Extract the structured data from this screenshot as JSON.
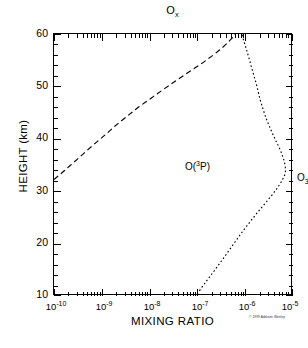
{
  "chart_data": {
    "type": "line",
    "title": "Ox",
    "title_base": "O",
    "title_sub": "x",
    "xlabel": "MIXING RATIO",
    "ylabel": "HEIGHT (km)",
    "xscale": "log",
    "yscale": "linear",
    "xlim": [
      1e-10,
      1e-05
    ],
    "ylim": [
      10,
      60
    ],
    "grid": false,
    "legend": "inline annotations",
    "x_tick_labels": [
      {
        "base": "10",
        "exp": "-10",
        "value": 1e-10
      },
      {
        "base": "10",
        "exp": "-9",
        "value": 1e-09
      },
      {
        "base": "10",
        "exp": "-8",
        "value": 1e-08
      },
      {
        "base": "10",
        "exp": "-7",
        "value": 1e-07
      },
      {
        "base": "10",
        "exp": "-6",
        "value": 1e-06
      },
      {
        "base": "10",
        "exp": "-5",
        "value": 1e-05
      }
    ],
    "y_tick_labels": [
      {
        "label": "10",
        "value": 10
      },
      {
        "label": "20",
        "value": 20
      },
      {
        "label": "30",
        "value": 30
      },
      {
        "label": "40",
        "value": 40
      },
      {
        "label": "50",
        "value": 50
      },
      {
        "label": "60",
        "value": 60
      }
    ],
    "y_minor_step": 2,
    "series": [
      {
        "name": "O(3P)",
        "label_base": "O(",
        "label_sup": "3",
        "label_tail": "P)",
        "linestyle": "dashed",
        "color": "#000000",
        "points": [
          {
            "x": 1e-10,
            "y": 32.0
          },
          {
            "x": 1.6e-10,
            "y": 33.6
          },
          {
            "x": 2.6e-10,
            "y": 35.3
          },
          {
            "x": 4.2e-10,
            "y": 37.0
          },
          {
            "x": 7e-10,
            "y": 38.8
          },
          {
            "x": 1.2e-09,
            "y": 40.6
          },
          {
            "x": 2e-09,
            "y": 42.4
          },
          {
            "x": 3.4e-09,
            "y": 44.1
          },
          {
            "x": 6e-09,
            "y": 45.9
          },
          {
            "x": 1.1e-08,
            "y": 47.6
          },
          {
            "x": 2e-08,
            "y": 49.3
          },
          {
            "x": 3.6e-08,
            "y": 50.9
          },
          {
            "x": 6.5e-08,
            "y": 52.5
          },
          {
            "x": 1.2e-07,
            "y": 54.1
          },
          {
            "x": 2.1e-07,
            "y": 55.7
          },
          {
            "x": 3.4e-07,
            "y": 57.2
          },
          {
            "x": 4.8e-07,
            "y": 58.5
          },
          {
            "x": 6e-07,
            "y": 59.4
          },
          {
            "x": 6.6e-07,
            "y": 60.0
          }
        ]
      },
      {
        "name": "O3",
        "label_base": "O",
        "label_sub": "3",
        "linestyle": "dotted",
        "color": "#000000",
        "points": [
          {
            "x": 1.05e-07,
            "y": 10.0
          },
          {
            "x": 1.5e-07,
            "y": 12.0
          },
          {
            "x": 2.2e-07,
            "y": 14.0
          },
          {
            "x": 3.2e-07,
            "y": 16.0
          },
          {
            "x": 4.6e-07,
            "y": 18.0
          },
          {
            "x": 6.6e-07,
            "y": 20.0
          },
          {
            "x": 9.5e-07,
            "y": 22.0
          },
          {
            "x": 1.4e-06,
            "y": 24.0
          },
          {
            "x": 2.1e-06,
            "y": 26.0
          },
          {
            "x": 3.2e-06,
            "y": 28.0
          },
          {
            "x": 4.8e-06,
            "y": 30.0
          },
          {
            "x": 6.6e-06,
            "y": 32.0
          },
          {
            "x": 7.6e-06,
            "y": 33.4
          },
          {
            "x": 7.4e-06,
            "y": 35.0
          },
          {
            "x": 6.6e-06,
            "y": 36.6
          },
          {
            "x": 5.6e-06,
            "y": 38.2
          },
          {
            "x": 4.6e-06,
            "y": 39.8
          },
          {
            "x": 3.8e-06,
            "y": 41.5
          },
          {
            "x": 3.1e-06,
            "y": 43.4
          },
          {
            "x": 2.6e-06,
            "y": 45.4
          },
          {
            "x": 2.2e-06,
            "y": 47.6
          },
          {
            "x": 1.9e-06,
            "y": 50.0
          },
          {
            "x": 1.6e-06,
            "y": 52.4
          },
          {
            "x": 1.35e-06,
            "y": 54.8
          },
          {
            "x": 1.15e-06,
            "y": 57.0
          },
          {
            "x": 1e-06,
            "y": 58.8
          },
          {
            "x": 9.2e-07,
            "y": 60.0
          }
        ]
      }
    ],
    "annotations": [
      {
        "name": "o3p-curve-label",
        "text": "O(3P)"
      },
      {
        "name": "o3-curve-label",
        "text": "O3"
      }
    ]
  },
  "credit": {
    "text": "© 1999 Addison Wesley"
  }
}
